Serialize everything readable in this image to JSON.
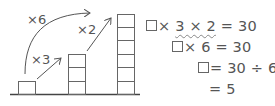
{
  "diagram": {
    "stacks": [
      {
        "label": "1 block",
        "count": 1
      },
      {
        "label": "3 blocks",
        "count": 3
      },
      {
        "label": "6 blocks",
        "count": 6
      }
    ],
    "arrows": [
      {
        "label": "×3",
        "from": "stack-1",
        "to": "stack-2"
      },
      {
        "label": "×2",
        "from": "stack-2",
        "to": "stack-3"
      },
      {
        "label": "×6",
        "from": "stack-1",
        "to": "stack-3"
      }
    ]
  },
  "equations": {
    "line1": {
      "prefix": "× ",
      "underlined": "3 × 2",
      "suffix": " = 30"
    },
    "line2": {
      "text": "× 6 = 30"
    },
    "line3": {
      "text": "= 30 ÷ 6"
    },
    "line4": {
      "text": "= 5"
    }
  },
  "colors": {
    "stroke": "#555555",
    "text": "#555555"
  }
}
